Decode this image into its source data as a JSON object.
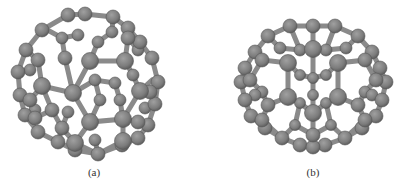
{
  "figure": {
    "panels": [
      {
        "id": "a",
        "caption": "(a)",
        "description": "Fullerene cage ball-and-stick model, view a",
        "atom_color": "#7a7a7a",
        "bond_color": "#8c8c8c"
      },
      {
        "id": "b",
        "caption": "(b)",
        "description": "Fullerene cage ball-and-stick model, view b",
        "atom_color": "#7a7a7a",
        "bond_color": "#8c8c8c"
      }
    ]
  }
}
